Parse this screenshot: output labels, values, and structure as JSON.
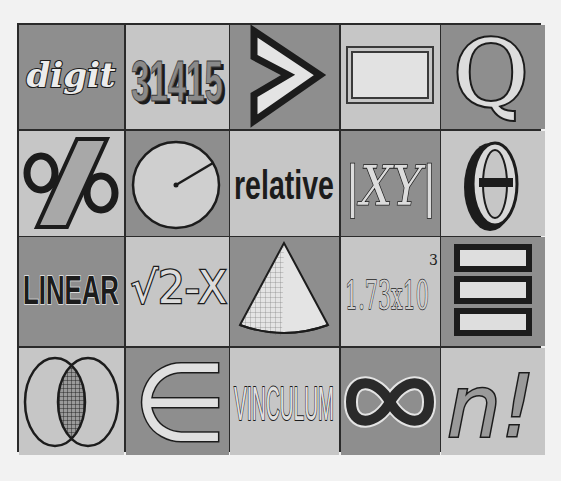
{
  "palette": {
    "page_bg": "#f2f2f2",
    "grid_line": "#2a2a2a",
    "cell_dark": "#8e8e8e",
    "cell_light": "#c6c6c6",
    "ink": "#1c1c1c",
    "highlight": "#e8e8e8"
  },
  "tiles": [
    {
      "row": 1,
      "col": 1,
      "shade": "dark",
      "kind": "word",
      "text": "digit"
    },
    {
      "row": 1,
      "col": 2,
      "shade": "light",
      "kind": "number",
      "text": "31415"
    },
    {
      "row": 1,
      "col": 3,
      "shade": "dark",
      "kind": "symbol",
      "text": ">",
      "meaning": "greater-than"
    },
    {
      "row": 1,
      "col": 4,
      "shade": "light",
      "kind": "shape",
      "text": "",
      "meaning": "rectangle"
    },
    {
      "row": 1,
      "col": 5,
      "shade": "dark",
      "kind": "letter",
      "text": "Q"
    },
    {
      "row": 2,
      "col": 1,
      "shade": "light",
      "kind": "symbol",
      "text": "%",
      "meaning": "percent"
    },
    {
      "row": 2,
      "col": 2,
      "shade": "dark",
      "kind": "shape",
      "text": "",
      "meaning": "circle-radius"
    },
    {
      "row": 2,
      "col": 3,
      "shade": "light",
      "kind": "word",
      "text": "relative"
    },
    {
      "row": 2,
      "col": 4,
      "shade": "dark",
      "kind": "expression",
      "text": "|XY|",
      "meaning": "absolute-value"
    },
    {
      "row": 2,
      "col": 5,
      "shade": "light",
      "kind": "letter",
      "text": "θ",
      "meaning": "theta"
    },
    {
      "row": 3,
      "col": 1,
      "shade": "dark",
      "kind": "word",
      "text": "LINEAR"
    },
    {
      "row": 3,
      "col": 2,
      "shade": "light",
      "kind": "expression",
      "text": "√2-X",
      "meaning": "square-root"
    },
    {
      "row": 3,
      "col": 3,
      "shade": "dark",
      "kind": "shape",
      "text": "",
      "meaning": "cone"
    },
    {
      "row": 3,
      "col": 4,
      "shade": "light",
      "kind": "number",
      "text": "1.73x10",
      "superscript": "3",
      "meaning": "scientific-notation"
    },
    {
      "row": 3,
      "col": 5,
      "shade": "dark",
      "kind": "symbol",
      "text": "≡",
      "meaning": "identical-to"
    },
    {
      "row": 4,
      "col": 1,
      "shade": "light",
      "kind": "shape",
      "text": "",
      "meaning": "venn-intersection"
    },
    {
      "row": 4,
      "col": 2,
      "shade": "dark",
      "kind": "symbol",
      "text": "∈",
      "meaning": "element-of"
    },
    {
      "row": 4,
      "col": 3,
      "shade": "light",
      "kind": "word",
      "text": "VINCULUM"
    },
    {
      "row": 4,
      "col": 4,
      "shade": "dark",
      "kind": "symbol",
      "text": "∞",
      "meaning": "infinity"
    },
    {
      "row": 4,
      "col": 5,
      "shade": "light",
      "kind": "expression",
      "text": "n!",
      "meaning": "factorial"
    }
  ]
}
